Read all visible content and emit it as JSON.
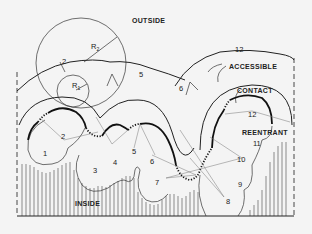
{
  "diagram": {
    "region_labels": {
      "outside": "OUTSIDE",
      "inside": "INSIDE"
    },
    "surface_labels": {
      "accessible": "ACCESSIBLE",
      "contact": "CONTACT",
      "reentrant": "REENTRANT"
    },
    "probe_radii": {
      "r1": "R",
      "r1_sub": "1",
      "r2": "R",
      "r2_sub": "2"
    },
    "atom_labels": [
      "1",
      "2",
      "3",
      "4",
      "5",
      "6",
      "7",
      "8",
      "9",
      "10",
      "11",
      "12"
    ],
    "accessible_arc_labels": {
      "a2": "2",
      "a5": "5",
      "a6": "6",
      "a12": "12"
    },
    "contact_label_12": "12"
  }
}
